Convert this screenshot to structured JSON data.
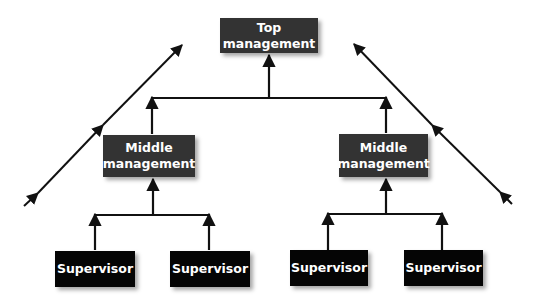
{
  "diagram": {
    "type": "organizational-hierarchy",
    "colors": {
      "management_box": "#333333",
      "supervisor_box": "#050505",
      "box_text": "#ffffff",
      "lines": "#111111",
      "background": "#ffffff"
    },
    "nodes": {
      "top": {
        "label": "Top\nmanagement"
      },
      "middle_left": {
        "label": "Middle\nmanagement"
      },
      "middle_right": {
        "label": "Middle\nmanagement"
      },
      "supervisor_1": {
        "label": "Supervisor"
      },
      "supervisor_2": {
        "label": "Supervisor"
      },
      "supervisor_3": {
        "label": "Supervisor"
      },
      "supervisor_4": {
        "label": "Supervisor"
      }
    },
    "edges": [
      {
        "from": "middle_left",
        "to": "top"
      },
      {
        "from": "middle_right",
        "to": "top"
      },
      {
        "from": "supervisor_1",
        "to": "middle_left"
      },
      {
        "from": "supervisor_2",
        "to": "middle_left"
      },
      {
        "from": "supervisor_3",
        "to": "middle_right"
      },
      {
        "from": "supervisor_4",
        "to": "middle_right"
      }
    ],
    "side_arrows": [
      {
        "side": "left",
        "direction": "up-right",
        "arrowheads": 3
      },
      {
        "side": "right",
        "direction": "up-left",
        "arrowheads": 3
      }
    ]
  }
}
